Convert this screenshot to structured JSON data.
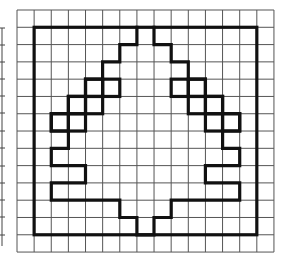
{
  "figure": {
    "title": "",
    "grid": {
      "columns": 15,
      "rows": 14,
      "origin_x": 17,
      "origin_y": 10,
      "cell_w": 17.13,
      "cell_h": 17.29,
      "line_color": "#555555"
    },
    "ink_color": "#111111",
    "frame": {
      "from": [
        1,
        1
      ],
      "to": [
        14,
        13
      ]
    },
    "tree_outline": [
      [
        7,
        1
      ],
      [
        7,
        2
      ],
      [
        6,
        2
      ],
      [
        6,
        3
      ],
      [
        5,
        3
      ],
      [
        5,
        4
      ],
      [
        4,
        4
      ],
      [
        4,
        5
      ],
      [
        3,
        5
      ],
      [
        3,
        6
      ],
      [
        2,
        6
      ],
      [
        2,
        7
      ],
      [
        3,
        7
      ],
      [
        3,
        8
      ],
      [
        2,
        8
      ],
      [
        2,
        9
      ],
      [
        4,
        9
      ],
      [
        4,
        10
      ],
      [
        2,
        10
      ],
      [
        2,
        11
      ],
      [
        6,
        11
      ],
      [
        6,
        12
      ],
      [
        7,
        12
      ],
      [
        7,
        13
      ],
      [
        8,
        13
      ],
      [
        8,
        12
      ],
      [
        9,
        12
      ],
      [
        9,
        11
      ],
      [
        13,
        11
      ],
      [
        13,
        10
      ],
      [
        11,
        10
      ],
      [
        11,
        9
      ],
      [
        13,
        9
      ],
      [
        13,
        8
      ],
      [
        12,
        8
      ],
      [
        12,
        7
      ],
      [
        13,
        7
      ],
      [
        13,
        6
      ],
      [
        12,
        6
      ],
      [
        12,
        5
      ],
      [
        11,
        5
      ],
      [
        11,
        4
      ],
      [
        10,
        4
      ],
      [
        10,
        3
      ],
      [
        9,
        3
      ],
      [
        9,
        2
      ],
      [
        8,
        2
      ],
      [
        8,
        1
      ]
    ],
    "outlined_cells": [
      [
        4,
        4
      ],
      [
        5,
        4
      ],
      [
        3,
        5
      ],
      [
        4,
        5
      ],
      [
        2,
        6
      ],
      [
        3,
        6
      ],
      [
        9,
        4
      ],
      [
        10,
        4
      ],
      [
        10,
        5
      ],
      [
        11,
        5
      ],
      [
        11,
        6
      ],
      [
        12,
        6
      ]
    ],
    "neighbor_grid_edge": {
      "x": 2,
      "y_top": 28,
      "y_bottom": 246,
      "tick_rows": [
        28,
        45,
        62,
        79,
        96,
        113,
        131,
        148,
        166,
        183,
        200,
        217,
        235
      ]
    }
  }
}
